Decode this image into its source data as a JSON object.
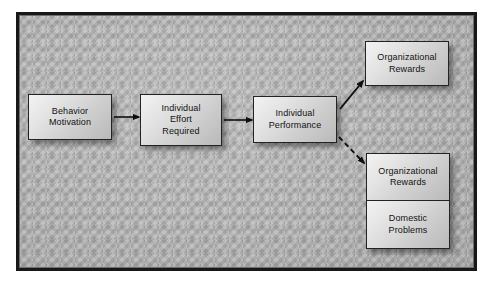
{
  "diagram": {
    "frame": {
      "border_color": "#18181a",
      "background_color": "#b2b2b2"
    },
    "nodes": [
      {
        "id": "behavior-motivation",
        "label": "Behavior\nMotivation"
      },
      {
        "id": "individual-effort-required",
        "label": "Individual\nEffort\nRequired"
      },
      {
        "id": "individual-performance",
        "label": "Individual\nPerformance"
      },
      {
        "id": "organizational-rewards-top",
        "label": "Organizational\nRewards"
      },
      {
        "id": "organizational-rewards-bottom",
        "label": "Organizational\nRewards"
      },
      {
        "id": "domestic-problems",
        "label": "Domestic\nProblems"
      }
    ],
    "connectors": [
      {
        "id": "motivation-to-effort",
        "from": "behavior-motivation",
        "to": "individual-effort-required",
        "style": "solid",
        "arrow": "right"
      },
      {
        "id": "effort-to-performance",
        "from": "individual-effort-required",
        "to": "individual-performance",
        "style": "solid",
        "arrow": "right"
      },
      {
        "id": "performance-to-rewards",
        "from": "individual-performance",
        "to": "organizational-rewards-top",
        "style": "solid",
        "arrow": "up-right"
      },
      {
        "id": "performance-to-outcomes",
        "from": "individual-performance",
        "to": "organizational-rewards-bottom",
        "style": "dashed",
        "arrow": "down-right"
      }
    ]
  }
}
